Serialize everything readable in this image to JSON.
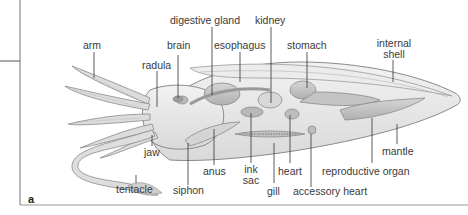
{
  "figure": {
    "panel_letter": "a",
    "labels": {
      "arm": "arm",
      "radula": "radula",
      "brain": "brain",
      "digestive_gland": "digestive gland",
      "esophagus": "esophagus",
      "kidney": "kidney",
      "stomach": "stomach",
      "internal_shell_1": "internal",
      "internal_shell_2": "shell",
      "jaw": "jaw",
      "tentacle": "tentacle",
      "siphon": "siphon",
      "anus": "anus",
      "ink_sac_1": "ink",
      "ink_sac_2": "sac",
      "gill": "gill",
      "heart": "heart",
      "accessory_heart": "accessory heart",
      "reproductive_organ": "reproductive organ",
      "mantle": "mantle"
    },
    "colors": {
      "body_fill": "#e6e6e6",
      "organ_fill": "#c9c9c9",
      "outline": "#8a8a8a",
      "leader_line": "#333333",
      "frame": "#777777"
    }
  }
}
